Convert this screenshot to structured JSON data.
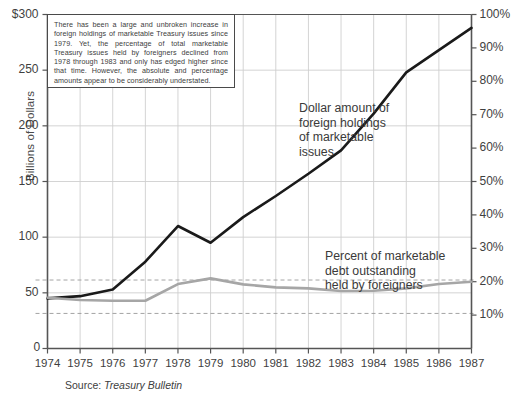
{
  "note": {
    "text": "There has been a large and unbroken increase in foreign holdings of marketable Treasury issues since 1979. Yet, the percentage of total marketable Treasury issues held by foreigners declined from 1978 through 1983 and only has edged higher since that time. However, the absolute and percentage amounts appear to be considerably understated."
  },
  "source": {
    "label": "Source: ",
    "value": "Treasury Bulletin"
  },
  "annotations": {
    "dollar": "Dollar amount of\nforeign holdings\nof marketable\nissues",
    "percent": "Percent of marketable\ndebt outstanding\nheld by foreigners"
  },
  "chart_data": {
    "type": "line",
    "title": "",
    "xlabel": "",
    "ylabel": "Billions of Dollars",
    "y2label": "",
    "x": [
      1974,
      1975,
      1976,
      1977,
      1978,
      1979,
      1980,
      1981,
      1982,
      1983,
      1984,
      1985,
      1986,
      1987
    ],
    "xticklabels": [
      "1974",
      "1975",
      "1976",
      "1977",
      "1978",
      "1979",
      "1980",
      "1981",
      "1982",
      "1983",
      "1984",
      "1985",
      "1986",
      "1987"
    ],
    "ylim": [
      0,
      300
    ],
    "yticks": [
      0,
      50,
      100,
      150,
      200,
      250,
      300
    ],
    "yticklabels": [
      "0",
      "50",
      "100",
      "150",
      "200",
      "250",
      "$300"
    ],
    "y2lim": [
      0,
      10
    ],
    "y2ticks": [
      1,
      2,
      3,
      4,
      5,
      6,
      7,
      8,
      9,
      10
    ],
    "y2ticklabels": [
      "10%",
      "20%",
      "30%",
      "40%",
      "50%",
      "60%",
      "70%",
      "80%",
      "90%",
      "100%"
    ],
    "y2ticklabels_visible": [
      "1",
      "2",
      "3",
      "4",
      "5",
      "6",
      "7",
      "8",
      "9",
      "10"
    ],
    "grid": true,
    "legend": "annotations-inline",
    "reference_lines": [
      {
        "axis": "right",
        "value": 2.05,
        "style": "dashed",
        "color": "#9a9a9a"
      },
      {
        "axis": "right",
        "value": 1.05,
        "style": "dashed",
        "color": "#9a9a9a"
      }
    ],
    "series": [
      {
        "name": "Dollar amount of foreign holdings of marketable issues",
        "axis": "left",
        "unit": "Billions of Dollars",
        "color": "#1a1a1a",
        "width": 2.6,
        "values": [
          45,
          47,
          53,
          78,
          110,
          95,
          118,
          137,
          157,
          178,
          211,
          248,
          268,
          288
        ]
      },
      {
        "name": "Percent of marketable debt outstanding held by foreigners",
        "axis": "right",
        "unit": "percent",
        "color": "#a6a6a6",
        "width": 2.6,
        "values": [
          1.52,
          1.45,
          1.43,
          1.43,
          1.93,
          2.1,
          1.92,
          1.83,
          1.8,
          1.72,
          1.73,
          1.8,
          1.93,
          2.0
        ]
      }
    ]
  }
}
